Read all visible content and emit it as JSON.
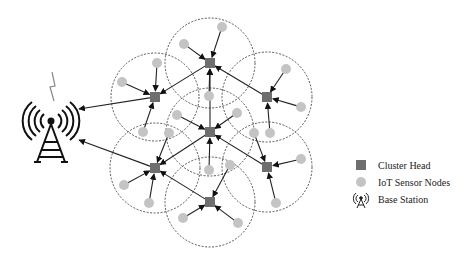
{
  "colors": {
    "cluster_head": "#6e6e6e",
    "sensor_node": "#c4c4c4",
    "line": "#222222",
    "circle": "#444444",
    "lightning": "#888888"
  },
  "legend": {
    "cluster_head_label": "Cluster Head",
    "sensor_label": "IoT Sensor Nodes",
    "base_station_label": "Base Station"
  },
  "base_station": {
    "x": 51,
    "y": 121,
    "icon": "radio-tower-icon"
  },
  "clusters": [
    {
      "id": "top",
      "ch": [
        210,
        63
      ],
      "r": 45,
      "sensors": [
        [
          222,
          27
        ],
        [
          184,
          44
        ],
        [
          209,
          96
        ]
      ]
    },
    {
      "id": "left-upper",
      "ch": [
        155,
        97
      ],
      "r": 44,
      "sensors": [
        [
          157,
          63
        ],
        [
          122,
          82
        ],
        [
          143,
          132
        ]
      ]
    },
    {
      "id": "right-upper",
      "ch": [
        267,
        97
      ],
      "r": 45,
      "sensors": [
        [
          286,
          69
        ],
        [
          301,
          107
        ],
        [
          270,
          133
        ]
      ]
    },
    {
      "id": "center",
      "ch": [
        210,
        132
      ],
      "r": 44,
      "sensors": [
        [
          177,
          115
        ],
        [
          237,
          113
        ],
        [
          209,
          170
        ]
      ]
    },
    {
      "id": "left-lower",
      "ch": [
        155,
        168
      ],
      "r": 45,
      "sensors": [
        [
          124,
          185
        ],
        [
          149,
          203
        ],
        [
          169,
          133
        ]
      ]
    },
    {
      "id": "right-lower",
      "ch": [
        267,
        167
      ],
      "r": 45,
      "sensors": [
        [
          301,
          159
        ],
        [
          276,
          203
        ],
        [
          254,
          133
        ]
      ]
    },
    {
      "id": "bottom",
      "ch": [
        210,
        202
      ],
      "r": 45,
      "sensors": [
        [
          183,
          218
        ],
        [
          238,
          223
        ],
        [
          230,
          165
        ]
      ]
    }
  ],
  "ch_links": [
    {
      "from": "top",
      "to": "left-upper"
    },
    {
      "from": "right-upper",
      "to": "top"
    },
    {
      "from": "center",
      "to": "top"
    },
    {
      "from": "center",
      "to": "left-lower"
    },
    {
      "from": "right-lower",
      "to": "center"
    },
    {
      "from": "bottom",
      "to": "left-lower"
    },
    {
      "from": "left-upper",
      "to": "base"
    },
    {
      "from": "left-lower",
      "to": "base"
    }
  ]
}
